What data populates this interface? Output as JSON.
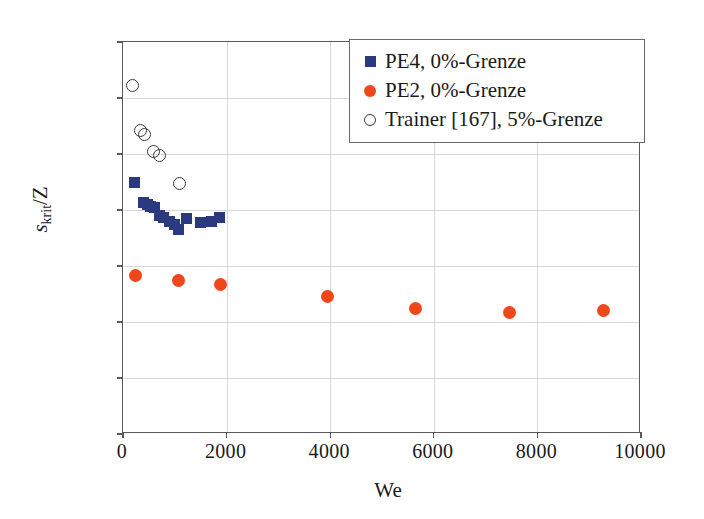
{
  "chart_data": {
    "type": "scatter",
    "title": "",
    "xlabel": "We",
    "ylabel": "s_krit/Z",
    "ylabel_parts": {
      "main": "s",
      "sub": "krit",
      "tail": "/Z"
    },
    "xlim": [
      0,
      10000
    ],
    "ylim": [
      0,
      1.4
    ],
    "xticks": [
      0,
      2000,
      4000,
      6000,
      8000,
      10000
    ],
    "xtick_labels": [
      "0",
      "2000",
      "4000",
      "6000",
      "8000",
      "10000"
    ],
    "yticks": [
      0,
      0.2,
      0.4,
      0.6,
      0.8,
      1.0,
      1.2,
      1.4
    ],
    "ytick_labels": [
      "0",
      "0,2",
      "0,4",
      "0,6",
      "0,8",
      "1,0",
      "1,2",
      "1,4"
    ],
    "grid": true,
    "legend_position": "top-right",
    "series": [
      {
        "name": "PE4, 0%-Grenze",
        "marker": "filled-square",
        "color": "#2b3a7e",
        "points": [
          [
            220,
            0.9
          ],
          [
            400,
            0.828
          ],
          [
            470,
            0.818
          ],
          [
            530,
            0.812
          ],
          [
            600,
            0.808
          ],
          [
            700,
            0.782
          ],
          [
            790,
            0.772
          ],
          [
            900,
            0.76
          ],
          [
            1000,
            0.748
          ],
          [
            1080,
            0.73
          ],
          [
            1230,
            0.77
          ],
          [
            1500,
            0.757
          ],
          [
            1700,
            0.76
          ],
          [
            1870,
            0.772
          ]
        ]
      },
      {
        "name": "PE2, 0%-Grenze",
        "marker": "filled-circle",
        "color": "#f0471a",
        "points": [
          [
            250,
            0.565
          ],
          [
            1080,
            0.55
          ],
          [
            1880,
            0.535
          ],
          [
            3950,
            0.49
          ],
          [
            5650,
            0.45
          ],
          [
            7470,
            0.435
          ],
          [
            9270,
            0.442
          ]
        ]
      },
      {
        "name": "Trainer [167], 5%-Grenze",
        "marker": "open-circle",
        "color": "#3a3a3a",
        "points": [
          [
            190,
            1.245
          ],
          [
            330,
            1.085
          ],
          [
            420,
            1.07
          ],
          [
            580,
            1.01
          ],
          [
            700,
            0.995
          ],
          [
            1090,
            0.895
          ]
        ]
      }
    ]
  },
  "legend": {
    "items": [
      {
        "label": "PE4, 0%-Grenze",
        "marker": "filled-square",
        "color": "#2b3a7e"
      },
      {
        "label": "PE2, 0%-Grenze",
        "marker": "filled-circle",
        "color": "#f0471a"
      },
      {
        "label": "Trainer [167], 5%-Grenze",
        "marker": "open-circle",
        "color": "#3a3a3a"
      }
    ]
  }
}
